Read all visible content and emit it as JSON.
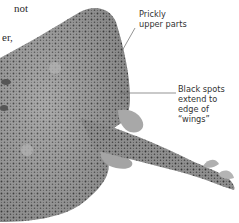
{
  "page": {
    "body_text_fragments": [
      "not",
      "er,"
    ]
  },
  "illustration": {
    "subject": "ray (skate) specimen, dorsal view",
    "colors": {
      "body": "#9a9a9a",
      "body_dark": "#6e6e6e",
      "spots": "#2e2e2e",
      "leader_line": "#555555"
    }
  },
  "callouts": [
    {
      "id": "prickly",
      "lines": [
        "Prickly",
        "upper parts"
      ]
    },
    {
      "id": "spots",
      "lines": [
        "Black spots",
        "extend to",
        "edge of",
        "“wings”"
      ]
    }
  ]
}
